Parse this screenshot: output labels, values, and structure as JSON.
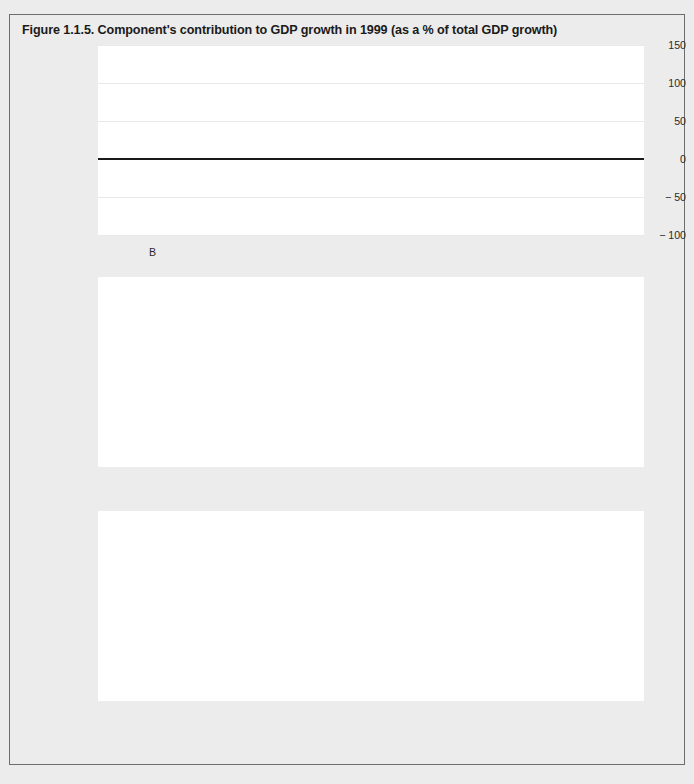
{
  "figure": {
    "title": "Figure 1.1.5. Component's contribution to GDP growth in 1999 (as a % of total GDP growth)",
    "caption": ""
  },
  "legend": {
    "position": "bottom-center",
    "items": [
      {
        "label": "Household consumption",
        "color": "#f8f8f8",
        "icon": "legend-swatch-icon"
      },
      {
        "label": "Government consumption",
        "color": "#a9a9a9",
        "icon": "legend-swatch-icon"
      },
      {
        "label": "GFCF",
        "color": "#414141",
        "icon": "legend-swatch-icon"
      },
      {
        "label": "Trade balance",
        "color": "#e4e4e4",
        "icon": "legend-swatch-icon"
      }
    ]
  },
  "axis": {
    "yticks": [
      "150",
      "100",
      "50",
      "0",
      "− 50",
      "− 100"
    ],
    "yvalues": [
      150,
      100,
      50,
      0,
      -50,
      -100
    ],
    "ylim": [
      -100,
      150
    ],
    "ylabel": "",
    "xlabel": ""
  },
  "chart_data": {
    "type": "bar",
    "title": "Figure 1.1.5. Component's contribution to GDP growth in 1999 (as a % of total GDP growth)",
    "xlabel": "",
    "ylabel": "% of total GDP growth",
    "ylim": [
      -100,
      150
    ],
    "grid": true,
    "legend_position": "bottom-center",
    "series_names": [
      "Household consumption",
      "Government consumption",
      "GFCF",
      "Trade balance"
    ],
    "series_colors": [
      "#f8f8f8",
      "#a9a9a9",
      "#414141",
      "#e4e4e4"
    ],
    "panels": [
      {
        "index": 1,
        "categories": [
          "B",
          "DK",
          "D",
          "EL",
          "E"
        ],
        "series": [
          {
            "name": "Household consumption",
            "values": [
              33,
              0,
              22,
              18,
              45
            ]
          },
          {
            "name": "Government consumption",
            "values": [
              22,
              17,
              1,
              1,
              7
            ]
          },
          {
            "name": "GFCF",
            "values": [
              43,
              -9,
              35,
              53,
              51
            ]
          },
          {
            "name": "Trade balance",
            "values": [
              31,
              133,
              -53,
              -10,
              -31
            ]
          }
        ]
      },
      {
        "index": 2,
        "categories": [
          "F",
          "IRL",
          "I",
          "L",
          "NL"
        ],
        "series": [
          {
            "name": "Household consumption",
            "values": [
              30,
              13,
              14,
              2,
              28
            ]
          },
          {
            "name": "Government consumption",
            "values": [
              19,
              5,
              8,
              27,
              16
            ]
          },
          {
            "name": "GFCF",
            "values": [
              45,
              32,
              58,
              27,
              34
            ]
          },
          {
            "name": "Trade balance",
            "values": [
              2,
              12,
              -69,
              -23,
              1
            ]
          }
        ]
      },
      {
        "index": 3,
        "categories": [
          "A",
          "P",
          "FIN",
          "S",
          "UK"
        ],
        "series": [
          {
            "name": "Household consumption",
            "values": [
              27,
              33,
              45,
              14,
              122
            ]
          },
          {
            "name": "Government consumption",
            "values": [
              18,
              25,
              0,
              10,
              38
            ]
          },
          {
            "name": "GFCF",
            "values": [
              36,
              59,
              27,
              34,
              47
            ]
          },
          {
            "name": "Trade balance",
            "values": [
              -7,
              -80,
              57,
              14,
              -77
            ]
          }
        ]
      }
    ]
  }
}
